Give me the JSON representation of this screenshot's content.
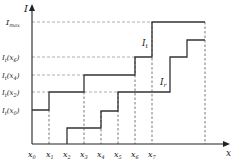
{
  "axes": {
    "y_label": "I",
    "x_label": "x"
  },
  "y_levels": [
    {
      "label": "I",
      "sub": "max",
      "arg": "",
      "y": 22
    },
    {
      "label": "I",
      "sub": "t",
      "arg": "x",
      "argsub": "6",
      "y": 57
    },
    {
      "label": "I",
      "sub": "t",
      "arg": "x",
      "argsub": "4",
      "y": 75
    },
    {
      "label": "I",
      "sub": "t",
      "arg": "x",
      "argsub": "2",
      "y": 92
    },
    {
      "label": "I",
      "sub": "t",
      "arg": "x",
      "argsub": "0",
      "y": 110
    }
  ],
  "x_ticks": [
    {
      "label": "x",
      "sub": "0",
      "x": 32
    },
    {
      "label": "x",
      "sub": "1",
      "x": 49
    },
    {
      "label": "x",
      "sub": "2",
      "x": 67
    },
    {
      "label": "x",
      "sub": "3",
      "x": 84
    },
    {
      "label": "x",
      "sub": "4",
      "x": 101
    },
    {
      "label": "x",
      "sub": "5",
      "x": 118
    },
    {
      "label": "x",
      "sub": "6",
      "x": 135
    },
    {
      "label": "x",
      "sub": "7",
      "x": 152
    }
  ],
  "curves": {
    "It": {
      "label": "I",
      "sub": "t"
    },
    "Ir": {
      "label": "I",
      "sub": "r"
    }
  }
}
